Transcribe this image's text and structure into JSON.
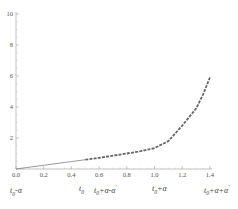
{
  "chart_data": {
    "type": "line",
    "title": "",
    "xlabel": "",
    "ylabel": "",
    "xlim": [
      0.0,
      1.4
    ],
    "ylim": [
      0,
      10
    ],
    "grid": false,
    "legend": null,
    "x_ticks": [
      "0.0",
      "0.2",
      "0.4",
      "0.6",
      "0.8",
      "1.0",
      "1.2",
      "1.4"
    ],
    "y_ticks": [
      "2",
      "4",
      "6",
      "8",
      "10"
    ],
    "series": [
      {
        "name": "solid segment",
        "style": "solid-thin",
        "color": "#555555",
        "x": [
          0.0,
          0.1,
          0.2,
          0.3,
          0.4,
          0.5
        ],
        "y": [
          0.0,
          0.12,
          0.24,
          0.36,
          0.48,
          0.6
        ]
      },
      {
        "name": "dashed segment",
        "style": "dashed-thick",
        "color": "#666666",
        "x": [
          0.5,
          0.6,
          0.7,
          0.8,
          0.9,
          1.0,
          1.1,
          1.2,
          1.3,
          1.35,
          1.4
        ],
        "y": [
          0.6,
          0.72,
          0.86,
          1.0,
          1.15,
          1.35,
          1.8,
          2.8,
          3.9,
          4.8,
          5.9
        ]
      }
    ],
    "annotations": [
      {
        "text": "t0-α",
        "x_pos": 0.0
      },
      {
        "text": "t0",
        "x_pos": 0.5
      },
      {
        "text": "t0+α-α'",
        "x_pos": 0.62
      },
      {
        "text": "t0+α",
        "x_pos": 1.05
      },
      {
        "text": "t0+α+α'",
        "x_pos": 1.45
      }
    ]
  },
  "labels": {
    "annot_1_base": "t",
    "annot_1_sub": "0",
    "annot_1_rest": "-α",
    "annot_2_base": "t",
    "annot_2_sub": "0",
    "annot_3_base": "t",
    "annot_3_sub": "0",
    "annot_3_rest": "+α-α",
    "annot_3_sup": "′",
    "annot_4_base": "t",
    "annot_4_sub": "0",
    "annot_4_rest": "+α",
    "annot_5_base": "t",
    "annot_5_sub": "0",
    "annot_5_rest": "+α+α",
    "annot_5_sup": "′"
  }
}
